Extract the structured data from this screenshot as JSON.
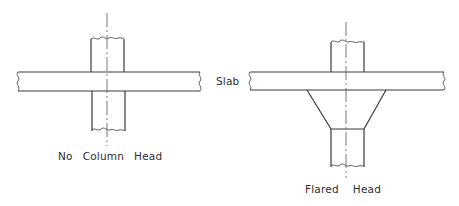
{
  "figure": {
    "left_caption": {
      "words": [
        "No",
        "Column",
        "Head"
      ],
      "text": "No Column Head"
    },
    "right_caption": {
      "words": [
        "Flared",
        "Head"
      ],
      "text": "Flared Head"
    },
    "slab_label": "Slab"
  },
  "elements": {
    "left_diagram": {
      "slab": {
        "x1": 18,
        "x2": 200,
        "y_top": 72,
        "y_bottom": 91
      },
      "column": {
        "x_left": 91,
        "x_right": 125,
        "y_top": 38,
        "y_bottom": 131
      },
      "centerline": {
        "x": 107,
        "y1": 13,
        "y2": 146
      }
    },
    "right_diagram": {
      "slab": {
        "x1": 250,
        "x2": 444,
        "y_top": 72,
        "y_bottom": 90
      },
      "upper_column": {
        "x_left": 331,
        "x_right": 364,
        "y_top": 41
      },
      "flare": {
        "top_left_x": 307,
        "top_right_x": 386,
        "top_y": 90,
        "bottom_left_x": 331,
        "bottom_right_x": 364,
        "bottom_y": 129
      },
      "lower_column": {
        "x_left": 331,
        "x_right": 364,
        "y_bottom": 167
      },
      "centerline": {
        "x": 346,
        "y1": 22,
        "y2": 178
      }
    }
  },
  "colors": {
    "line": "#3a3a3a",
    "text": "#2e2e2e",
    "background": "#ffffff"
  }
}
